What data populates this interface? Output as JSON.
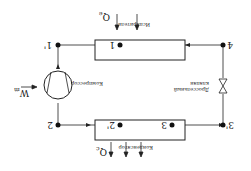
{
  "labels": {
    "evaporator": "Испаритель",
    "condenser": "Конденсатор",
    "compressor": "Компрессор",
    "valve_line1": "Дроссельный",
    "valve_line2": "клапан",
    "work": "W",
    "work_sub": "m",
    "q_evap": "Q",
    "q_evap_sub": "e",
    "q_cond": "Q",
    "q_cond_sub": "c"
  },
  "points": {
    "p1prime": "1'",
    "p1": "1",
    "p2": "2",
    "p2prime": "2'",
    "p3prime": "3'",
    "p3": "3",
    "p4": "4"
  }
}
